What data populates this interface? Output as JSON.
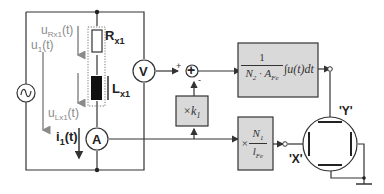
{
  "diagram": {
    "type": "circuit-and-block-diagram",
    "colors": {
      "line": "#333333",
      "block_fill": "#d9d9d9",
      "block_stroke": "#333333",
      "arrow_gray": "#8a8a8a",
      "inductor": "#111111"
    },
    "circuit": {
      "source_symbol": "~",
      "voltages": {
        "u1": {
          "main": "u",
          "sub": "1",
          "tail": "(t)"
        },
        "uRx1": {
          "main": "u",
          "sub": "Rx1",
          "tail": "(t)"
        },
        "uLx1": {
          "main": "u",
          "sub": "Lx1",
          "tail": "(t)"
        }
      },
      "current": {
        "main": "i",
        "sub": "1",
        "tail": "(t)"
      },
      "resistor": {
        "main": "R",
        "sub": "x1"
      },
      "inductor": {
        "main": "L",
        "sub": "x1"
      },
      "voltmeter": "V",
      "ammeter": "A"
    },
    "blocks": {
      "summer": {
        "symbol": "+",
        "plus": "+",
        "minus": "-"
      },
      "gain_k1": {
        "prefix": "×k",
        "sub": "1"
      },
      "integrator": {
        "num": "1",
        "den_N": "N",
        "den_N_sub": "2",
        "den_dot": " · ",
        "den_A": "A",
        "den_A_sub": "Fe",
        "integral": "∫u(t)dt"
      },
      "scale_x": {
        "times": "×",
        "num_N": "N",
        "num_sub": "1",
        "den_l": "l",
        "den_sub": "Fe"
      }
    },
    "oscilloscope": {
      "y_label": "'Y'",
      "x_label": "'X'"
    }
  }
}
